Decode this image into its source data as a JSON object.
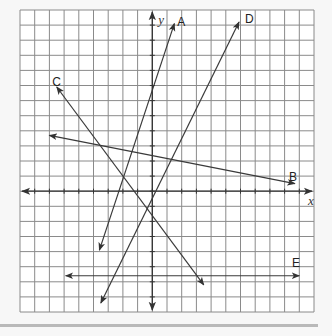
{
  "diagram": {
    "type": "coordinate-plane",
    "grid": {
      "x_min": -9,
      "x_max": 11,
      "y_min": -8,
      "y_max": 12,
      "grid_color": "#8a8a8a",
      "axis_color": "#333333",
      "background": "#ffffff"
    },
    "axes": {
      "x_label": "x",
      "y_label": "y"
    },
    "lines": [
      {
        "name": "A",
        "label": "A",
        "from": [
          -3.6,
          -3.9
        ],
        "to": [
          1.5,
          11.1
        ],
        "arrows": "both",
        "label_pos": [
          1.7,
          11.3
        ]
      },
      {
        "name": "D",
        "label": "D",
        "from": [
          -3.5,
          -7.4
        ],
        "to": [
          5.9,
          11.2
        ],
        "arrows": "both",
        "label_pos": [
          6.3,
          11.5
        ]
      },
      {
        "name": "C",
        "label": "C",
        "from": [
          -6.5,
          6.9
        ],
        "to": [
          3.5,
          -6.2
        ],
        "arrows": "both",
        "label_pos": [
          -6.8,
          7.3
        ]
      },
      {
        "name": "B",
        "label": "B",
        "from": [
          -7.0,
          3.7
        ],
        "to": [
          9.7,
          0.5
        ],
        "arrows": "both",
        "label_pos": [
          9.3,
          1.0
        ]
      },
      {
        "name": "E",
        "label": "E",
        "from": [
          -5.9,
          -5.6
        ],
        "to": [
          10.0,
          -5.6
        ],
        "arrows": "both",
        "label_pos": [
          9.5,
          -4.7
        ]
      }
    ],
    "line_color": "#3a3a3a"
  }
}
